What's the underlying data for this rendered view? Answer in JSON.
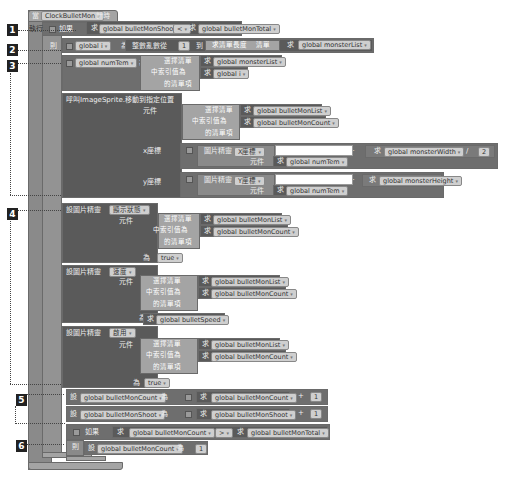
{
  "event": {
    "component": "ClockBulletMon",
    "event_name": "計時"
  },
  "labels": {
    "n1": "1",
    "n2": "2",
    "n3": "3",
    "n4": "4",
    "n5": "5",
    "n6": "6"
  },
  "if1": {
    "exec_label": "執行",
    "if_label": "如果",
    "left_get": "求",
    "left_var": "global bulletMonShoot",
    "op": "<",
    "right_get": "求",
    "right_var": "global bulletMonTotal"
  },
  "then_label": "則",
  "for_range": {
    "set_label": "對",
    "var": "global i",
    "as_label": "為",
    "func": "整數亂數從",
    "from": "1",
    "to_label": "到",
    "length_func": "求清單長度",
    "list_label": "清單",
    "get": "求",
    "list_var": "global monsterList"
  },
  "set_numtem": {
    "set_label": "設",
    "var": "global numTem",
    "as_label": "為",
    "select_item": "選擇清單",
    "list_get": "求",
    "list_var": "global monsterList",
    "index_label": "中索引值為",
    "index_get": "求",
    "index_var": "global i",
    "item_label": "的清單項"
  },
  "call_moveto": {
    "title": "呼叫ImageSprite.移動到指定位置",
    "component_label": "元件",
    "select_item": "選擇清單",
    "list_get": "求",
    "list_var": "global bulletMonList",
    "index_label": "中索引值為",
    "index_get": "求",
    "index_var": "global bulletMonCount",
    "item_label": "的清單項",
    "x_label": "x座標",
    "x_sprite": "圖片精靈",
    "x_prop": "X座標",
    "x_comp_label": "元件",
    "x_comp_get": "求",
    "x_comp_var": "global numTem",
    "x_op": "+",
    "x_get": "求",
    "x_var": "global monsterWidth",
    "x_div": "/",
    "x_num": "2",
    "y_label": "y座標",
    "y_sprite": "圖片精靈",
    "y_prop": "Y座標",
    "y_comp_label": "元件",
    "y_comp_get": "求",
    "y_comp_var": "global numTem",
    "y_op": "+",
    "y_get": "求",
    "y_var": "global monsterHeight"
  },
  "set_visible": {
    "title": "設圖片精靈",
    "prop": "顯示狀態",
    "component_label": "元件",
    "select_item": "選擇清單",
    "list_get": "求",
    "list_var": "global bulletMonList",
    "index_label": "中索引值為",
    "index_get": "求",
    "index_var": "global bulletMonCount",
    "item_label": "的清單項",
    "as_label": "為",
    "value": "true"
  },
  "set_speed": {
    "title": "設圖片精靈",
    "prop": "速度",
    "component_label": "元件",
    "select_item": "選擇清單",
    "list_get": "求",
    "list_var": "global bulletMonList",
    "index_label": "中索引值為",
    "index_get": "求",
    "index_var": "global bulletMonCount",
    "item_label": "的清單項",
    "as_label": "為",
    "value_get": "求",
    "value_var": "global bulletSpeed"
  },
  "set_enabled": {
    "title": "設圖片精靈",
    "prop": "啟用",
    "component_label": "元件",
    "select_item": "選擇清單",
    "list_get": "求",
    "list_var": "global bulletMonList",
    "index_label": "中索引值為",
    "index_get": "求",
    "index_var": "global bulletMonCount",
    "item_label": "的清單項",
    "as_label": "為",
    "value": "true"
  },
  "inc_count": {
    "set_label": "設",
    "var": "global bulletMonCount",
    "as_label": "為",
    "get": "求",
    "get_var": "global bulletMonCount",
    "op": "+",
    "num": "1"
  },
  "inc_shoot": {
    "set_label": "設",
    "var": "global bulletMonShoot",
    "as_label": "為",
    "get": "求",
    "get_var": "global bulletMonShoot",
    "op": "+",
    "num": "1"
  },
  "if2": {
    "if_label": "如果",
    "left_get": "求",
    "left_var": "global bulletMonCount",
    "op": ">",
    "right_get": "求",
    "right_var": "global bulletMonTotal",
    "then_label": "則",
    "set_label": "設",
    "set_var": "global bulletMonCount",
    "as_label": "為",
    "value": "1"
  }
}
